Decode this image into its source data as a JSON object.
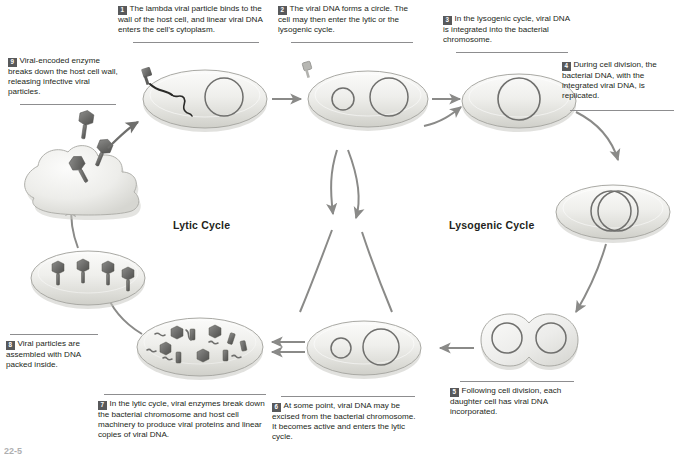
{
  "figure": {
    "cycle_labels": {
      "lytic": "Lytic Cycle",
      "lysogenic": "Lysogenic Cycle"
    },
    "page_number": "22-5"
  },
  "palette": {
    "cell_fill_light": "#f2f2f0",
    "cell_fill_mid": "#dcdcd8",
    "cell_outline": "#a6a6a2",
    "dna_ring": "#6f6f6d",
    "phage_dark": "#6a6a68",
    "arrow": "#8a8a88",
    "badge_bg": "#58595b",
    "text": "#231f20",
    "rule": "#8d8d8f"
  },
  "steps": [
    {
      "number": "1",
      "text": "The lambda viral particle binds to the wall of the host cell, and linear viral DNA enters the cell's cytoplasm."
    },
    {
      "number": "2",
      "text": "The viral DNA forms a circle. The cell may then enter the lytic or the lysogenic cycle."
    },
    {
      "number": "3",
      "text": "In the lysogenic cycle, viral DNA is integrated into the bacterial chromosome."
    },
    {
      "number": "4",
      "text": "During cell division, the bacterial DNA, with the integrated viral DNA, is replicated."
    },
    {
      "number": "5",
      "text": "Following cell division, each daughter cell has viral DNA incorporated."
    },
    {
      "number": "6",
      "text": "At some point, viral DNA may be excised from the bacterial chromosome. It becomes active and enters the lytic cycle."
    },
    {
      "number": "7",
      "text": "In the lytic cycle, viral enzymes break down the bacterial chromosome and host cell machinery to produce viral proteins and linear copies of viral DNA."
    },
    {
      "number": "8",
      "text": "Viral particles are assembled with DNA packed inside."
    },
    {
      "number": "9",
      "text": "Viral-encoded enzyme breaks down the host cell wall, releasing infective viral particles."
    }
  ]
}
